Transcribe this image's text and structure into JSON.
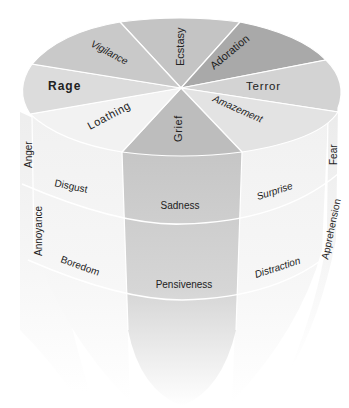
{
  "diagram": {
    "top_sectors": [
      {
        "label": "Ecstasy",
        "color": "#c4c4c4"
      },
      {
        "label": "Adoration",
        "color": "#a9a9a9"
      },
      {
        "label": "Terror",
        "color": "#d3d3d3"
      },
      {
        "label": "Amazement",
        "color": "#e3e3e3"
      },
      {
        "label": "Grief",
        "color": "#bdbdbd"
      },
      {
        "label": "Loathing",
        "color": "#f2f2f2"
      },
      {
        "label": "Rage",
        "color": "#dcdcdc"
      },
      {
        "label": "Vigilance",
        "color": "#c9c9c9"
      }
    ],
    "side_edge_labels": {
      "left_upper": "Anger",
      "left_lower": "Annoyance",
      "right_upper": "Fear",
      "right_lower": "Apprehension"
    },
    "front_faces": {
      "left_middle": "Disgust",
      "left_lower": "Boredom",
      "center_middle": "Sadness",
      "center_lower": "Pensiveness",
      "right_middle": "Surprise",
      "right_lower": "Distraction"
    },
    "colors": {
      "center_column": "#c8c8c8",
      "side_faces": "#f4f4f4",
      "separator": "#ffffff",
      "text": "#222222"
    }
  }
}
